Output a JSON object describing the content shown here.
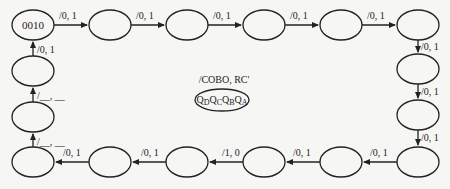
{
  "diagram": {
    "initial_state": "0010",
    "legend": {
      "transition_format": "/COBO, RC'",
      "state_format": "Q",
      "state_subscripts": [
        "D",
        "C",
        "B",
        "A"
      ]
    },
    "transitions": {
      "t1": "/0, 1",
      "t2": "/0, 1",
      "t3": "/0, 1",
      "t4": "/0, 1",
      "t5": "/0, 1",
      "t6": "/0, 1",
      "t7": "/0, 1",
      "t8": "/0, 1",
      "t9": "/0, 1",
      "t10": "/0, 1",
      "t11": "/1, 0",
      "t12": "/0, 1",
      "t13": "/0, 1",
      "t14": "/__, __",
      "t15": "/__, __",
      "t16": "/0, 1"
    }
  }
}
